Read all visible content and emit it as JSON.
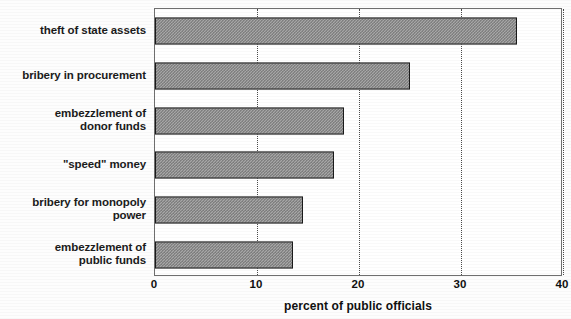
{
  "chart_data": {
    "type": "bar",
    "orientation": "horizontal",
    "title": "",
    "xlabel": "percent of public officials",
    "ylabel": "",
    "xlim": [
      0,
      40
    ],
    "ylim": null,
    "grid": true,
    "legend": false,
    "xticks": [
      "0",
      "10",
      "20",
      "30",
      "40"
    ],
    "xtick_values": [
      0,
      10,
      20,
      30,
      40
    ],
    "categories": [
      "theft of state assets",
      "bribery in procurement",
      "embezzlement of\ndonor funds",
      "\"speed\" money",
      "bribery for monopoly\npower",
      "embezzlement of\npublic funds"
    ],
    "values": [
      35.5,
      25,
      18.5,
      17.5,
      14.5,
      13.5
    ],
    "bars": [
      {
        "label": "theft of state assets",
        "value": 35.5
      },
      {
        "label": "bribery in procurement",
        "value": 25
      },
      {
        "label": "embezzlement of\ndonor funds",
        "value": 18.5
      },
      {
        "label": "\"speed\" money",
        "value": 17.5
      },
      {
        "label": "bribery for monopoly\npower",
        "value": 14.5
      },
      {
        "label": "embezzlement of\npublic funds",
        "value": 13.5
      }
    ],
    "bar_fill_color": "#a8a8a8",
    "bar_edge_color": "#1a1a1a",
    "gridline_color": "#4a4a4a",
    "axis_color": "#6f6f6f",
    "text_color": "#101010",
    "background_color": "#ffffff"
  }
}
